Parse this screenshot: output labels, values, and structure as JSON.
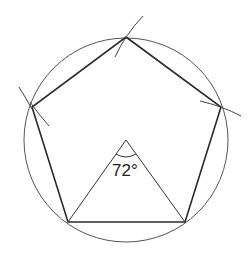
{
  "diagram": {
    "angle_label": "72°",
    "colors": {
      "stroke": "#2a2a2a",
      "circle": "#555555",
      "background": "#ffffff"
    }
  }
}
